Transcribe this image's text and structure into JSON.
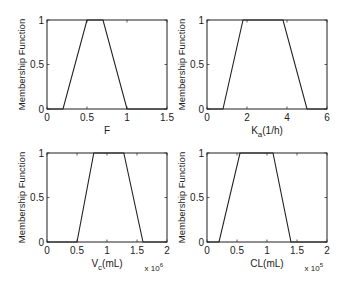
{
  "chart_data": [
    {
      "type": "line",
      "title": "",
      "xlabel": "F",
      "xlabel_sub": "",
      "xlabel_suffix": "",
      "ylabel": "Membership Function",
      "x": [
        0,
        0.2,
        0.5,
        0.7,
        1.0,
        1.5
      ],
      "values": [
        0,
        0,
        1,
        1,
        0,
        0
      ],
      "trapezoid": [
        0.2,
        0.5,
        0.7,
        1.0
      ],
      "xlim": [
        0,
        1.5
      ],
      "ylim": [
        0,
        1
      ],
      "xticks": [
        0,
        0.5,
        1,
        1.5
      ],
      "xtick_labels": [
        "0",
        "0.5",
        "1",
        "1.5"
      ],
      "yticks": [
        0,
        0.5,
        1
      ],
      "ytick_labels": [
        "0",
        "0.5",
        "1"
      ],
      "x_multiplier": "",
      "grid": false
    },
    {
      "type": "line",
      "title": "",
      "xlabel": "K",
      "xlabel_sub": "a",
      "xlabel_suffix": "(1/h)",
      "ylabel": "Membership Function",
      "x": [
        0,
        0.8,
        1.8,
        3.8,
        5.0,
        6
      ],
      "values": [
        0,
        0,
        1,
        1,
        0,
        0
      ],
      "trapezoid": [
        0.8,
        1.8,
        3.8,
        5.0
      ],
      "xlim": [
        0,
        6
      ],
      "ylim": [
        0,
        1
      ],
      "xticks": [
        0,
        2,
        4,
        6
      ],
      "xtick_labels": [
        "0",
        "2",
        "4",
        "6"
      ],
      "yticks": [
        0,
        0.5,
        1
      ],
      "ytick_labels": [
        "0",
        "0.5",
        "1"
      ],
      "x_multiplier": "",
      "grid": false
    },
    {
      "type": "line",
      "title": "",
      "xlabel": "V",
      "xlabel_sub": "c",
      "xlabel_suffix": "(mL)",
      "ylabel": "Membership Function",
      "x": [
        0,
        0.5,
        0.78,
        1.28,
        1.6,
        2
      ],
      "values": [
        0,
        0,
        1,
        1,
        0,
        0
      ],
      "trapezoid": [
        0.5,
        0.78,
        1.28,
        1.6
      ],
      "xlim": [
        0,
        2
      ],
      "ylim": [
        0,
        1
      ],
      "xticks": [
        0,
        0.5,
        1,
        1.5,
        2
      ],
      "xtick_labels": [
        "0",
        "0.5",
        "1",
        "1.5",
        "2"
      ],
      "yticks": [
        0,
        0.5,
        1
      ],
      "ytick_labels": [
        "0",
        "0.5",
        "1"
      ],
      "x_multiplier": "x 10",
      "x_multiplier_exp": "6",
      "grid": false
    },
    {
      "type": "line",
      "title": "",
      "xlabel": "CL(mL)",
      "xlabel_sub": "",
      "xlabel_suffix": "",
      "ylabel": "Membership Function",
      "x": [
        0,
        0.2,
        0.55,
        1.1,
        1.4,
        2
      ],
      "values": [
        0,
        0,
        1,
        1,
        0,
        0
      ],
      "trapezoid": [
        0.2,
        0.55,
        1.1,
        1.4
      ],
      "xlim": [
        0,
        2
      ],
      "ylim": [
        0,
        1
      ],
      "xticks": [
        0,
        0.5,
        1,
        1.5,
        2
      ],
      "xtick_labels": [
        "0",
        "0.5",
        "1",
        "1.5",
        "2"
      ],
      "yticks": [
        0,
        0.5,
        1
      ],
      "ytick_labels": [
        "0",
        "0.5",
        "1"
      ],
      "x_multiplier": "x 10",
      "x_multiplier_exp": "5",
      "grid": false
    }
  ],
  "layout": {
    "panels": [
      {
        "left": 47,
        "top": 20,
        "width": 120,
        "height": 89
      },
      {
        "left": 207,
        "top": 20,
        "width": 120,
        "height": 89
      },
      {
        "left": 47,
        "top": 153,
        "width": 120,
        "height": 89
      },
      {
        "left": 207,
        "top": 153,
        "width": 120,
        "height": 89
      }
    ],
    "line_color": "#222222",
    "frame_color": "#333333"
  }
}
